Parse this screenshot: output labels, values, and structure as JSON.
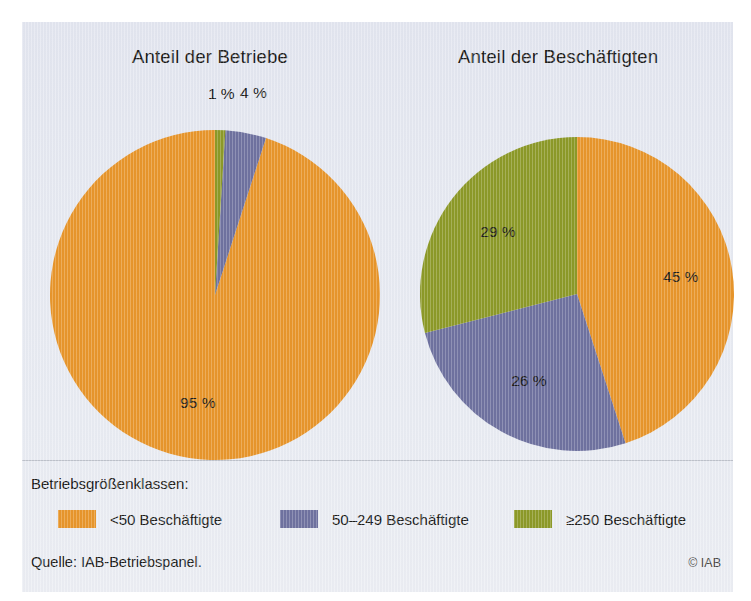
{
  "colors": {
    "orange": "#e8962c",
    "blue": "#6f72a0",
    "green": "#8d9a28",
    "panel_bg": "#e7eaf2",
    "text": "#1d1d1b"
  },
  "legend": {
    "title": "Betriebsgrößenklassen:",
    "items": [
      {
        "label": "<50 Beschäftigte",
        "color": "#e8962c",
        "swatch_name": "legend-swatch-small"
      },
      {
        "label": "50–249 Beschäftigte",
        "color": "#6f72a0",
        "swatch_name": "legend-swatch-medium"
      },
      {
        "label": "≥250 Beschäftigte",
        "color": "#8d9a28",
        "swatch_name": "legend-swatch-large"
      }
    ]
  },
  "footer": {
    "source": "Quelle: IAB-Betriebspanel.",
    "copyright": "© IAB"
  },
  "chart_data": [
    {
      "type": "pie",
      "title": "Anteil der Betriebe",
      "categories": [
        "<50 Beschäftigte",
        "50–249 Beschäftigte",
        "≥250 Beschäftigte"
      ],
      "values": [
        95,
        4,
        1
      ],
      "labels": [
        "95 %",
        "4 %",
        "1 %"
      ],
      "colors": [
        "#e8962c",
        "#6f72a0",
        "#8d9a28"
      ],
      "unit": "%",
      "legend_position": "bottom",
      "grid": false
    },
    {
      "type": "pie",
      "title": "Anteil der Beschäftigten",
      "categories": [
        "<50 Beschäftigte",
        "50–249 Beschäftigte",
        "≥250 Beschäftigte"
      ],
      "values": [
        45,
        26,
        29
      ],
      "labels": [
        "45 %",
        "26 %",
        "29 %"
      ],
      "colors": [
        "#e8962c",
        "#6f72a0",
        "#8d9a28"
      ],
      "unit": "%",
      "legend_position": "bottom",
      "grid": false
    }
  ]
}
